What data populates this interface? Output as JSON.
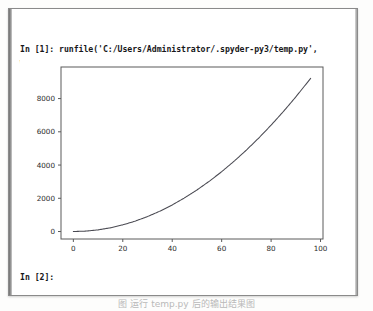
{
  "app": {
    "name": "Spyder IPython Console",
    "panel_label": "ipython-console-output"
  },
  "console": {
    "input_prompt_1": "In [1]:",
    "command": "runfile('C:/Users/Administrator/.spyder-py3/temp.py',",
    "command_line_2": "wdir='C:/Users/Administrator/.spyder-py3')",
    "full_command": "In [1]: runfile('C:/Users/Administrator/.spyder-py3/temp.py', wdir='C:/Users/Administrator/.spyder-py3')",
    "input_prompt_2": "In [2]:",
    "function_name": "runfile",
    "script_path": "C:/Users/Administrator/.spyder-py3/temp.py",
    "wdir_keyword": "wdir=",
    "wdir_path": "C:/Users/Administrator/.spyder-py3"
  },
  "caption": {
    "text": "图 运行 temp.py 后的输出结果图"
  },
  "colors": {
    "line": "#4a4a52",
    "axis": "#5a5a5a",
    "text": "#17171a",
    "panel_border": "#8a8a8a",
    "plot_bg": "#ffffff",
    "page_bg": "#fdfdfc"
  },
  "chart_data": {
    "type": "line",
    "title": "",
    "xlabel": "",
    "ylabel": "",
    "xlim": [
      -5,
      101
    ],
    "ylim": [
      -450,
      9900
    ],
    "xticks": [
      0,
      20,
      40,
      60,
      80,
      100
    ],
    "xtick_labels": [
      "0",
      "20",
      "40",
      "60",
      "80",
      "100"
    ],
    "yticks": [
      0,
      2000,
      4000,
      6000,
      8000
    ],
    "ytick_labels": [
      "0",
      "2000",
      "4000",
      "6000",
      "8000"
    ],
    "grid": false,
    "legend": false,
    "legend_position": "none",
    "series": [
      {
        "name": "y = x^2",
        "x": [
          0,
          5,
          10,
          15,
          20,
          25,
          30,
          35,
          40,
          45,
          50,
          55,
          60,
          65,
          70,
          75,
          80,
          85,
          90,
          96
        ],
        "values": [
          0,
          25,
          100,
          225,
          400,
          625,
          900,
          1225,
          1600,
          2025,
          2500,
          3025,
          3600,
          4225,
          4900,
          5625,
          6400,
          7225,
          8100,
          9216
        ]
      }
    ],
    "annotations": []
  }
}
